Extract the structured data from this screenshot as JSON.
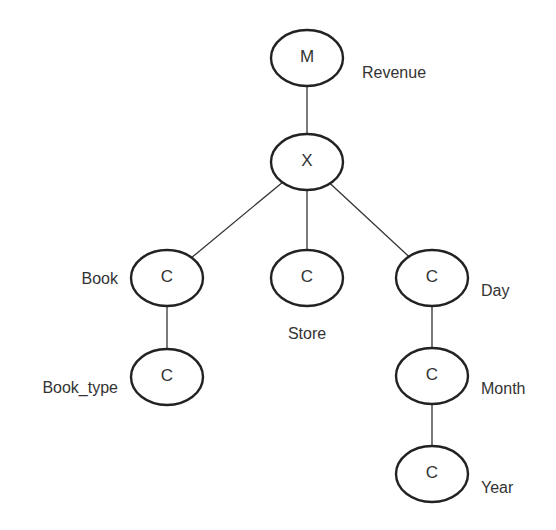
{
  "diagram": {
    "type": "tree",
    "nodes": [
      {
        "id": "m",
        "symbol": "M",
        "label": "Revenue",
        "cx": 307,
        "cy": 58,
        "label_x": 362,
        "label_y": 72,
        "label_anchor": "start"
      },
      {
        "id": "x",
        "symbol": "X",
        "label": "",
        "cx": 307,
        "cy": 162
      },
      {
        "id": "book",
        "symbol": "C",
        "label": "Book",
        "cx": 167,
        "cy": 278,
        "label_x": 118,
        "label_y": 278,
        "label_anchor": "end"
      },
      {
        "id": "store",
        "symbol": "C",
        "label": "Store",
        "cx": 307,
        "cy": 278,
        "label_x": 307,
        "label_y": 333,
        "label_anchor": "middle"
      },
      {
        "id": "day",
        "symbol": "C",
        "label": "Day",
        "cx": 432,
        "cy": 278,
        "label_x": 481,
        "label_y": 290,
        "label_anchor": "start"
      },
      {
        "id": "book_type",
        "symbol": "C",
        "label": "Book_type",
        "cx": 167,
        "cy": 377,
        "label_x": 118,
        "label_y": 387,
        "label_anchor": "end"
      },
      {
        "id": "month",
        "symbol": "C",
        "label": "Month",
        "cx": 432,
        "cy": 376,
        "label_x": 481,
        "label_y": 388,
        "label_anchor": "start"
      },
      {
        "id": "year",
        "symbol": "C",
        "label": "Year",
        "cx": 432,
        "cy": 474,
        "label_x": 481,
        "label_y": 487,
        "label_anchor": "start"
      }
    ],
    "edges": [
      {
        "from": "m",
        "to": "x"
      },
      {
        "from": "x",
        "to": "book"
      },
      {
        "from": "x",
        "to": "store"
      },
      {
        "from": "x",
        "to": "day"
      },
      {
        "from": "book",
        "to": "book_type"
      },
      {
        "from": "day",
        "to": "month"
      },
      {
        "from": "month",
        "to": "year"
      }
    ],
    "style": {
      "node_rx": 36,
      "node_ry": 28,
      "stroke_color": "#222222",
      "text_color": "#333333",
      "background": "#ffffff"
    }
  }
}
